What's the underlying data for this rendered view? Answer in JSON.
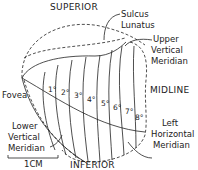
{
  "labels": {
    "superior": "SUPERIOR",
    "inferior": "INFERIOR",
    "midline": "MIDLINE",
    "fovea": "Fovea",
    "sulcus_line1": "Sulcus",
    "sulcus_line2": "Lunatus",
    "upper_vm_line1": "Upper",
    "upper_vm_line2": "Vertical",
    "upper_vm_line3": "Meridian",
    "lower_vm_line1": "Lower",
    "lower_vm_line2": "Vertical",
    "lower_vm_line3": "Meridian",
    "left_hm_line1": "Left",
    "left_hm_line2": "Horizontal",
    "left_hm_line3": "Meridian",
    "scale": "1CM"
  },
  "eccentricities": [
    "1°",
    "2°",
    "3°",
    "4°",
    "5°",
    "6°",
    "7°",
    "8°"
  ]
}
